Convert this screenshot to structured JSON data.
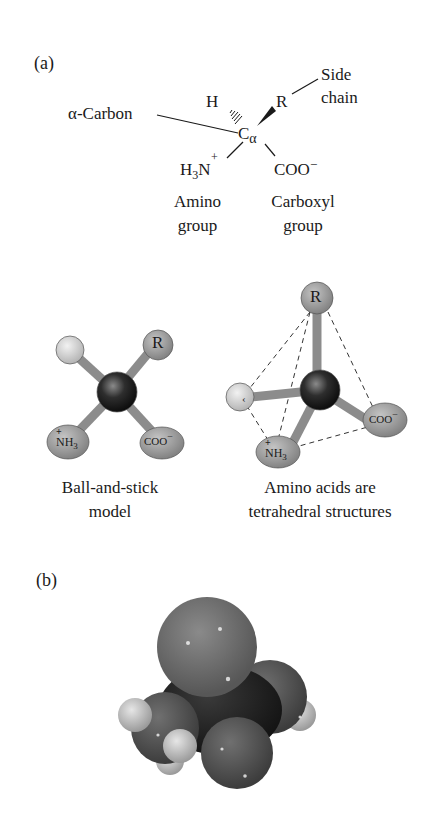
{
  "panel_a": {
    "label": "(a)",
    "structural_formula": {
      "alpha_carbon_callout": "α-Carbon",
      "side_chain_callout_line1": "Side",
      "side_chain_callout_line2": "chain",
      "h_atom": "H",
      "r_group": "R",
      "central_atom": "C",
      "central_atom_subscript": "α",
      "amino_group_formula_h": "H",
      "amino_group_formula_sub": "3",
      "amino_group_formula_n": "N",
      "amino_group_charge": "+",
      "carboxyl_formula": "COO",
      "carboxyl_charge": "−",
      "amino_caption_line1": "Amino",
      "amino_caption_line2": "group",
      "carboxyl_caption_line1": "Carboxyl",
      "carboxyl_caption_line2": "group"
    },
    "ball_and_stick": {
      "r_label": "R",
      "nh3_label": "NH",
      "nh3_sub": "3",
      "nh3_charge": "+",
      "coo_label": "COO",
      "coo_charge": "−",
      "caption_line1": "Ball-and-stick",
      "caption_line2": "model"
    },
    "tetrahedral": {
      "r_label": "R",
      "nh3_label": "NH",
      "nh3_sub": "3",
      "nh3_charge": "+",
      "coo_label": "COO",
      "coo_charge": "−",
      "caption_line1": "Amino acids are",
      "caption_line2": "tetrahedral structures"
    }
  },
  "panel_b": {
    "label": "(b)"
  },
  "colors": {
    "text": "#1a1a1a",
    "ball_gray": "#9a9a9a",
    "ball_light": "#d6d6d6",
    "carbon_dark": "#222222",
    "stick": "#8c8c8c",
    "oxygen_sphere": "#6e6e6e",
    "hydrogen_sphere": "#c8c8c8"
  }
}
